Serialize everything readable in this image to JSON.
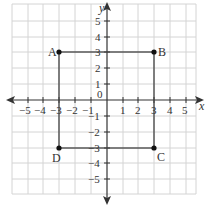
{
  "diagram": {
    "type": "coordinate-plane",
    "x_axis_label": "x",
    "y_axis_label": "y",
    "origin_label": "0",
    "x_range": [
      -5,
      5
    ],
    "y_range": [
      -5,
      5
    ],
    "x_ticks": [
      "-5",
      "-4",
      "-3",
      "-2",
      "-1",
      "1",
      "2",
      "3",
      "4",
      "5"
    ],
    "y_ticks": [
      "5",
      "4",
      "3",
      "2",
      "1",
      "-1",
      "-2",
      "-3",
      "-4",
      "-5"
    ],
    "points": [
      {
        "label": "A",
        "x": -3,
        "y": 3
      },
      {
        "label": "B",
        "x": 3,
        "y": 3
      },
      {
        "label": "C",
        "x": 3,
        "y": -3
      },
      {
        "label": "D",
        "x": -3,
        "y": -3
      }
    ],
    "shape": "square ABCD",
    "colors": {
      "grid": "#d4d4d4",
      "axis": "#333333",
      "shape": "#444444"
    }
  }
}
